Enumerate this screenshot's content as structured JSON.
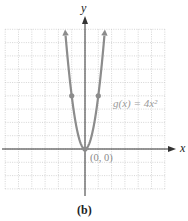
{
  "chart_data": {
    "type": "line",
    "title": "",
    "caption": "(b)",
    "xlabel": "x",
    "ylabel": "y",
    "xlim": [
      -6,
      6
    ],
    "ylim": [
      -3,
      9
    ],
    "grid": true,
    "series": [
      {
        "name": "g(x) = 4x^2",
        "function": "4x^2",
        "x": [
          -1.5,
          -1,
          -0.5,
          0,
          0.5,
          1,
          1.5
        ],
        "y": [
          9,
          4,
          1,
          0,
          1,
          4,
          9
        ],
        "color": "#8c8c8c"
      }
    ],
    "marked_points": [
      {
        "x": -1,
        "y": 4
      },
      {
        "x": 0,
        "y": 0
      },
      {
        "x": 1,
        "y": 4
      }
    ],
    "annotations": [
      {
        "text": "g(x) = 4x²",
        "x": 2,
        "y": 4
      },
      {
        "text": "(0, 0)",
        "x": 0,
        "y": 0
      }
    ]
  },
  "labels": {
    "x_axis": "x",
    "y_axis": "y",
    "function": "g(x) = 4x²",
    "vertex": "(0, 0)",
    "caption": "(b)"
  }
}
